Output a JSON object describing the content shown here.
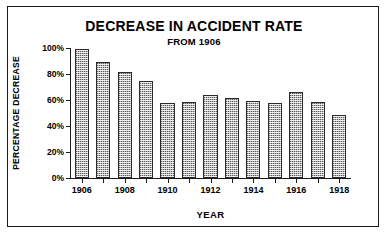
{
  "chart_data": {
    "type": "bar",
    "title": "DECREASE IN ACCIDENT RATE",
    "subtitle": "FROM 1906",
    "xlabel": "YEAR",
    "ylabel": "PERCENTAGE DECREASE",
    "ylim": [
      0,
      100
    ],
    "grid": false,
    "legend": null,
    "ytick_labels": [
      "100%",
      "80%",
      "60%",
      "40%",
      "20%",
      "0%"
    ],
    "ytick_values": [
      100,
      80,
      60,
      40,
      20,
      0
    ],
    "categories": [
      "1906",
      "1907",
      "1908",
      "1909",
      "1910",
      "1911",
      "1912",
      "1913",
      "1914",
      "1915",
      "1916",
      "1917",
      "1918"
    ],
    "xtick_labels_shown": [
      "1906",
      "1908",
      "1910",
      "1912",
      "1914",
      "1916",
      "1918"
    ],
    "values": [
      100,
      90,
      82,
      75,
      58,
      59,
      64,
      62,
      60,
      58,
      67,
      59,
      49
    ],
    "bar_fill_color": "#b9b9b9",
    "bar_edge_color": "#2a2a2a",
    "background_color": "#ffffff",
    "frame_color": "#1a1a1a"
  }
}
